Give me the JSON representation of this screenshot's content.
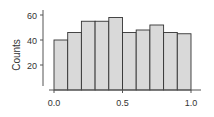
{
  "chart_data": {
    "type": "bar",
    "subtype": "histogram",
    "title": "",
    "xlabel": "",
    "ylabel": "Counts",
    "bin_edges": [
      0.0,
      0.1,
      0.2,
      0.3,
      0.4,
      0.5,
      0.6,
      0.7,
      0.8,
      0.9,
      1.0
    ],
    "categories": [
      "0.0-0.1",
      "0.1-0.2",
      "0.2-0.3",
      "0.3-0.4",
      "0.4-0.5",
      "0.5-0.6",
      "0.6-0.7",
      "0.7-0.8",
      "0.8-0.9",
      "0.9-1.0"
    ],
    "values": [
      40,
      46,
      55,
      55,
      58,
      46,
      48,
      52,
      46,
      45
    ],
    "xticks": [
      "0.0",
      "0.5",
      "1.0"
    ],
    "yticks": [
      "20",
      "40",
      "60"
    ],
    "xlim": [
      0.0,
      1.0
    ],
    "ylim": [
      0,
      65
    ],
    "grid": false,
    "legend": null,
    "colors": {
      "bar_fill": "#d9d9d9",
      "bar_edge": "#333333",
      "axis": "#555555"
    }
  }
}
